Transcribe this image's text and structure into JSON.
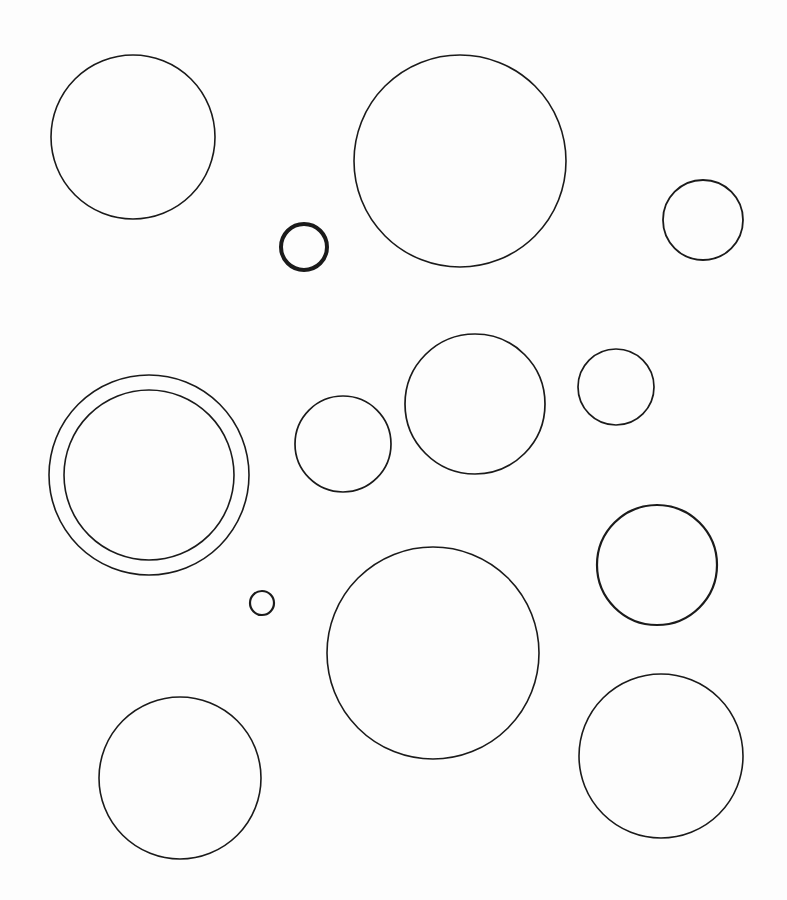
{
  "page": {
    "background": "#fdfdfd",
    "stroke_color": "#1a1a1a"
  },
  "diagram": {
    "type": "circles",
    "count": 14,
    "circles": [
      {
        "id": "circle-top-left",
        "cx": 133,
        "cy": 137,
        "r": 82,
        "stroke_width": 1.6
      },
      {
        "id": "circle-small-thick",
        "cx": 304,
        "cy": 247,
        "r": 23,
        "stroke_width": 4
      },
      {
        "id": "circle-top-center-large",
        "cx": 460,
        "cy": 161,
        "r": 106,
        "stroke_width": 1.6
      },
      {
        "id": "circle-top-right",
        "cx": 703,
        "cy": 220,
        "r": 40,
        "stroke_width": 1.8
      },
      {
        "id": "circle-double-outer",
        "cx": 149,
        "cy": 475,
        "r": 100,
        "stroke_width": 1.6
      },
      {
        "id": "circle-double-inner",
        "cx": 149,
        "cy": 475,
        "r": 85,
        "stroke_width": 1.6
      },
      {
        "id": "circle-mid-left",
        "cx": 343,
        "cy": 444,
        "r": 48,
        "stroke_width": 1.7
      },
      {
        "id": "circle-mid-center",
        "cx": 475,
        "cy": 404,
        "r": 70,
        "stroke_width": 1.7
      },
      {
        "id": "circle-mid-right",
        "cx": 616,
        "cy": 387,
        "r": 38,
        "stroke_width": 1.7
      },
      {
        "id": "circle-right-medium",
        "cx": 657,
        "cy": 565,
        "r": 60,
        "stroke_width": 2.2
      },
      {
        "id": "circle-tiny",
        "cx": 262,
        "cy": 603,
        "r": 12,
        "stroke_width": 2.2
      },
      {
        "id": "circle-bottom-center-large",
        "cx": 433,
        "cy": 653,
        "r": 106,
        "stroke_width": 1.6
      },
      {
        "id": "circle-bottom-left",
        "cx": 180,
        "cy": 778,
        "r": 81,
        "stroke_width": 1.6
      },
      {
        "id": "circle-bottom-right",
        "cx": 661,
        "cy": 756,
        "r": 82,
        "stroke_width": 1.6
      }
    ]
  }
}
